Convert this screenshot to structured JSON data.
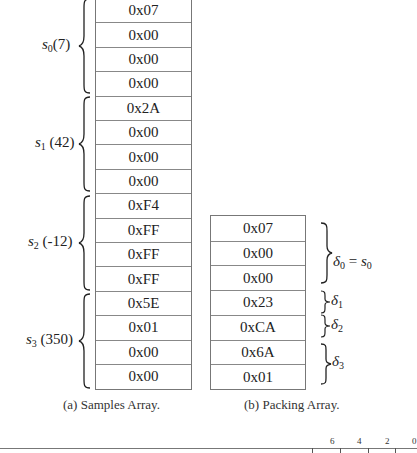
{
  "samples_array": {
    "caption": "(a) Samples Array.",
    "cells": [
      "0x07",
      "0x00",
      "0x00",
      "0x00",
      "0x2A",
      "0x00",
      "0x00",
      "0x00",
      "0xF4",
      "0xFF",
      "0xFF",
      "0xFF",
      "0x5E",
      "0x01",
      "0x00",
      "0x00"
    ],
    "groups": [
      {
        "symbol": "s",
        "sub": "0",
        "value": "(7)"
      },
      {
        "symbol": "s",
        "sub": "1",
        "value": "(42)"
      },
      {
        "symbol": "s",
        "sub": "2",
        "value": "(-12)"
      },
      {
        "symbol": "s",
        "sub": "3",
        "value": "(350)"
      }
    ]
  },
  "packing_array": {
    "caption": "(b) Packing Array.",
    "cells": [
      "0x07",
      "0x00",
      "0x00",
      "0x23",
      "0xCA",
      "0x6A",
      "0x01"
    ],
    "groups": [
      {
        "symbol": "δ",
        "sub": "0",
        "suffix": " = ",
        "eq_symbol": "s",
        "eq_sub": "0"
      },
      {
        "symbol": "δ",
        "sub": "1"
      },
      {
        "symbol": "δ",
        "sub": "2"
      },
      {
        "symbol": "δ",
        "sub": "3"
      }
    ]
  },
  "bit_ruler": {
    "tick_labels": [
      "6",
      "4",
      "2",
      "0"
    ]
  }
}
